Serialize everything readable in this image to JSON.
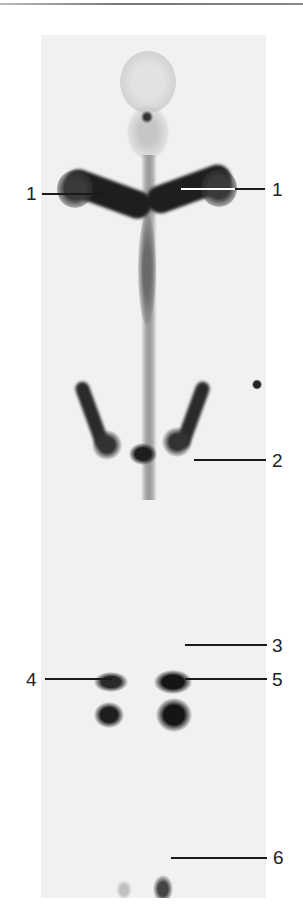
{
  "figure": {
    "labels": [
      {
        "id": "label-1-left",
        "text": "1"
      },
      {
        "id": "label-1-right",
        "text": "1"
      },
      {
        "id": "label-2",
        "text": "2"
      },
      {
        "id": "label-3",
        "text": "3"
      },
      {
        "id": "label-4",
        "text": "4"
      },
      {
        "id": "label-5",
        "text": "5"
      },
      {
        "id": "label-6",
        "text": "6"
      }
    ]
  }
}
